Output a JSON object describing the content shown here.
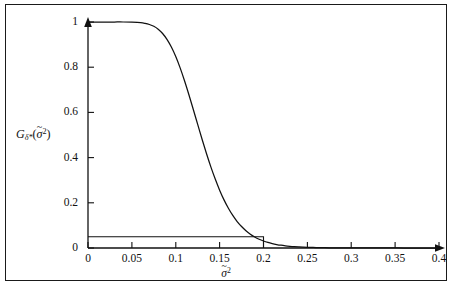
{
  "figure": {
    "background_color": "#ffffff",
    "border_color": "#1a1a1a",
    "curve_color": "#111111",
    "axis_color": "#111111"
  },
  "axes": {
    "x_ticks": [
      "0",
      "0.05",
      "0.1",
      "0.15",
      "0.2",
      "0.25",
      "0.3",
      "0.35",
      "0.4"
    ],
    "y_ticks": [
      "0",
      "0.2",
      "0.4",
      "0.6",
      "0.8",
      "1"
    ],
    "x_label_main": "σ",
    "x_label_tilde": "~",
    "x_label_sup": "2",
    "y_label_main": "G",
    "y_label_sub": "δ*",
    "y_label_open": "(",
    "y_label_arg": "σ",
    "y_label_arg_tilde": "~",
    "y_label_arg_sup": "2",
    "y_label_close": ")"
  },
  "chart_data": {
    "type": "line",
    "title": "",
    "xlabel": "σ̃2",
    "ylabel": "G_{δ*}(σ̃2)",
    "xlim": [
      0,
      0.4
    ],
    "ylim": [
      0,
      1
    ],
    "grid": false,
    "legend": "none",
    "series": [
      {
        "name": "G_{δ*}(σ̃2) power function",
        "x": [
          0.0,
          0.01,
          0.02,
          0.03,
          0.04,
          0.05,
          0.06,
          0.065,
          0.07,
          0.075,
          0.08,
          0.085,
          0.09,
          0.095,
          0.1,
          0.105,
          0.11,
          0.115,
          0.12,
          0.125,
          0.13,
          0.135,
          0.14,
          0.145,
          0.15,
          0.155,
          0.16,
          0.165,
          0.17,
          0.175,
          0.18,
          0.185,
          0.19,
          0.195,
          0.2,
          0.205,
          0.21,
          0.215,
          0.22,
          0.225,
          0.23,
          0.235,
          0.24,
          0.245,
          0.25,
          0.26,
          0.27,
          0.28,
          0.29,
          0.3,
          0.32,
          0.34,
          0.36,
          0.38,
          0.4
        ],
        "y": [
          1.0,
          1.0,
          1.0,
          1.0,
          1.0,
          0.999,
          0.997,
          0.994,
          0.989,
          0.981,
          0.968,
          0.949,
          0.923,
          0.889,
          0.847,
          0.797,
          0.74,
          0.678,
          0.613,
          0.547,
          0.481,
          0.418,
          0.359,
          0.305,
          0.256,
          0.213,
          0.176,
          0.144,
          0.117,
          0.095,
          0.0765,
          0.0613,
          0.0489,
          0.0389,
          0.0309,
          0.0245,
          0.0194,
          0.0154,
          0.0122,
          0.0097,
          0.0077,
          0.0061,
          0.0049,
          0.0039,
          0.0031,
          0.002,
          0.0013,
          0.0008,
          0.0005,
          0.0003,
          0.0001,
          0.0001,
          0.0,
          0.0,
          0.0
        ]
      },
      {
        "name": "size level reference line",
        "x": [
          0.0,
          0.2,
          0.2
        ],
        "y": [
          0.05,
          0.05,
          0.0
        ]
      }
    ],
    "annotations": [
      {
        "name": "alpha-level",
        "value": 0.05,
        "description": "horizontal reference line at G = 0.05"
      },
      {
        "name": "null-boundary",
        "value": 0.2,
        "description": "vertical drop at sigma-tilde squared = 0.2"
      }
    ]
  }
}
